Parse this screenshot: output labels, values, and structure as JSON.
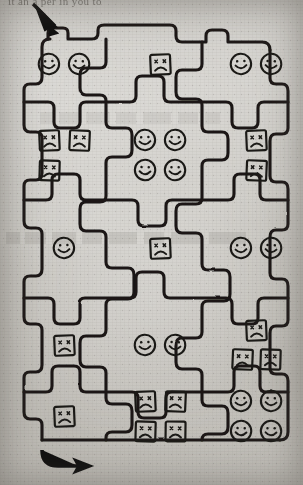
{
  "page": {
    "media": "scanned aged paper",
    "top_partial_text": "it an  a  per  in   you    to",
    "paper_color": "#d2d0cb",
    "ink_color": "#1a1916"
  },
  "maze": {
    "grid_columns": 3,
    "grid_rows": 5,
    "cell_shape": "rounded-interlocking-puzzle-cell",
    "entry": {
      "label": "entry-arrow",
      "position": "top-left",
      "direction": "down-right",
      "glyph": "↘"
    },
    "exit": {
      "label": "exit-arrow",
      "position": "bottom-left",
      "direction": "right",
      "glyph": "→"
    },
    "legend": [
      {
        "key": "smiley",
        "shape": "circle",
        "mouth": "smile",
        "meaning": "happy face"
      },
      {
        "key": "sad",
        "shape": "square",
        "mouth": "frown",
        "meaning": "sad face"
      }
    ],
    "cells": [
      {
        "row": 1,
        "col": 1,
        "type": "smiley",
        "count": 2,
        "layout": "1x2"
      },
      {
        "row": 1,
        "col": 2,
        "type": "sad",
        "count": 1,
        "layout": "1x1"
      },
      {
        "row": 1,
        "col": 3,
        "type": "smiley",
        "count": 2,
        "layout": "1x2"
      },
      {
        "row": 2,
        "col": 1,
        "type": "sad",
        "count": 3,
        "layout": "2-over-1"
      },
      {
        "row": 2,
        "col": 2,
        "type": "smiley",
        "count": 4,
        "layout": "2x2"
      },
      {
        "row": 2,
        "col": 3,
        "type": "sad",
        "count": 2,
        "layout": "2x1"
      },
      {
        "row": 3,
        "col": 1,
        "type": "smiley",
        "count": 1,
        "layout": "1x1"
      },
      {
        "row": 3,
        "col": 2,
        "type": "sad",
        "count": 1,
        "layout": "1x1"
      },
      {
        "row": 3,
        "col": 3,
        "type": "smiley",
        "count": 2,
        "layout": "1x2"
      },
      {
        "row": 4,
        "col": 1,
        "type": "sad",
        "count": 1,
        "layout": "1x1"
      },
      {
        "row": 4,
        "col": 2,
        "type": "smiley",
        "count": 2,
        "layout": "1x2"
      },
      {
        "row": 4,
        "col": 3,
        "type": "sad",
        "count": 3,
        "layout": "1-over-2"
      },
      {
        "row": 5,
        "col": 1,
        "type": "sad",
        "count": 1,
        "layout": "1x1"
      },
      {
        "row": 5,
        "col": 2,
        "type": "sad",
        "count": 4,
        "layout": "2x2"
      },
      {
        "row": 5,
        "col": 3,
        "type": "smiley",
        "count": 4,
        "layout": "2x2"
      }
    ],
    "totals": {
      "smiley_faces": 17,
      "sad_faces": 16,
      "total_faces": 33
    }
  }
}
